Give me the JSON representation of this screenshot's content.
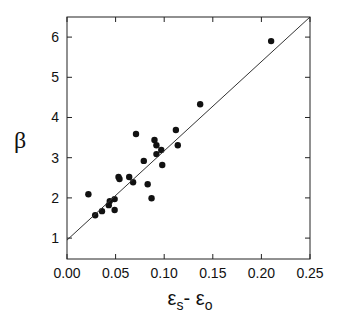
{
  "chart_data": {
    "type": "scatter",
    "title": "",
    "xlabel": "εs- εo",
    "xlabel_parts": {
      "main1": "ε",
      "sub1": "s",
      "sep": "- ",
      "main2": "ε",
      "sub2": "o"
    },
    "ylabel": "β",
    "xlim": [
      0.0,
      0.25
    ],
    "ylim": [
      0.48,
      6.5
    ],
    "xticks": [
      0.0,
      0.05,
      0.1,
      0.15,
      0.2,
      0.25
    ],
    "xtick_labels": [
      "0.00",
      "0.05",
      "0.10",
      "0.15",
      "0.20",
      "0.25"
    ],
    "yticks": [
      1,
      2,
      3,
      4,
      5,
      6
    ],
    "ytick_labels": [
      "1",
      "2",
      "3",
      "4",
      "5",
      "6"
    ],
    "grid": false,
    "legend": null,
    "series": [
      {
        "name": "data",
        "marker": "filled-circle",
        "color": "#111111",
        "points": [
          [
            0.022,
            2.09
          ],
          [
            0.029,
            1.57
          ],
          [
            0.036,
            1.67
          ],
          [
            0.043,
            1.82
          ],
          [
            0.044,
            1.92
          ],
          [
            0.049,
            1.97
          ],
          [
            0.049,
            1.7
          ],
          [
            0.053,
            2.52
          ],
          [
            0.054,
            2.47
          ],
          [
            0.064,
            2.52
          ],
          [
            0.068,
            2.39
          ],
          [
            0.071,
            3.59
          ],
          [
            0.079,
            2.92
          ],
          [
            0.083,
            2.34
          ],
          [
            0.087,
            1.99
          ],
          [
            0.09,
            3.44
          ],
          [
            0.092,
            3.31
          ],
          [
            0.092,
            3.09
          ],
          [
            0.097,
            3.19
          ],
          [
            0.098,
            2.82
          ],
          [
            0.112,
            3.69
          ],
          [
            0.114,
            3.31
          ],
          [
            0.137,
            4.33
          ],
          [
            0.21,
            5.9
          ]
        ]
      },
      {
        "name": "fit",
        "type": "line",
        "color": "#333333",
        "points": [
          [
            0.0,
            0.95
          ],
          [
            0.25,
            6.5
          ]
        ]
      }
    ]
  }
}
